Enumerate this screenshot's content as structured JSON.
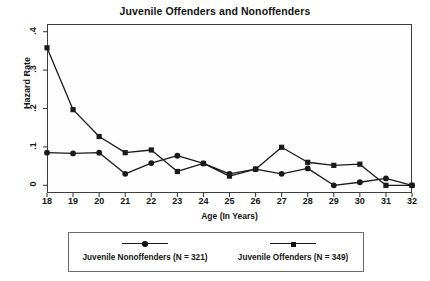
{
  "chart_data": {
    "type": "line",
    "title": "Juvenile Offenders and Nonoffenders",
    "xlabel": "Age (In Years)",
    "ylabel": "Hazard Rate",
    "grid": false,
    "legend_position": "bottom",
    "x": [
      18,
      19,
      20,
      21,
      22,
      23,
      24,
      25,
      26,
      27,
      28,
      29,
      30,
      31,
      32
    ],
    "xtick_labels": [
      "18",
      "19",
      "20",
      "21",
      "22",
      "23",
      "24",
      "25",
      "26",
      "27",
      "28",
      "29",
      "30",
      "31",
      "32"
    ],
    "ytick_labels": [
      "0",
      ".1",
      ".2",
      ".3",
      ".4"
    ],
    "ytick_values": [
      0,
      0.1,
      0.2,
      0.3,
      0.4
    ],
    "xlim": [
      18,
      32
    ],
    "ylim": [
      -0.02,
      0.42
    ],
    "series": [
      {
        "name": "Juvenile Nonoffenders (N = 321)",
        "marker": "circle",
        "values": [
          0.085,
          0.083,
          0.085,
          0.03,
          0.058,
          0.077,
          0.057,
          0.03,
          0.042,
          0.03,
          0.044,
          0.0,
          0.008,
          0.018,
          0.0
        ]
      },
      {
        "name": "Juvenile Offenders (N = 349)",
        "marker": "square",
        "values": [
          0.358,
          0.197,
          0.127,
          0.085,
          0.092,
          0.036,
          0.057,
          0.024,
          0.042,
          0.099,
          0.06,
          0.052,
          0.055,
          0.0,
          0.0
        ]
      }
    ]
  },
  "legend": {
    "entries": [
      {
        "label": "Juvenile Nonoffenders (N = 321)",
        "marker": "circle"
      },
      {
        "label": "Juvenile Offenders (N = 349)",
        "marker": "square"
      }
    ]
  },
  "colors": {
    "line": "#1a1a1a",
    "frame": "#3d3d3d",
    "background": "#ffffff",
    "text": "#141414"
  }
}
